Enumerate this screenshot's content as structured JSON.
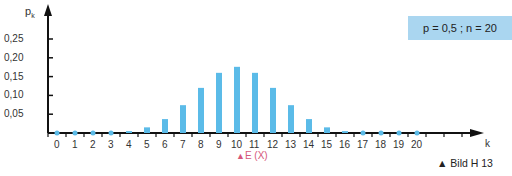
{
  "chart_data": {
    "type": "bar",
    "title": "",
    "xlabel": "k",
    "ylabel": "p_k",
    "categories": [
      "0",
      "1",
      "2",
      "3",
      "4",
      "5",
      "6",
      "7",
      "8",
      "9",
      "10",
      "11",
      "12",
      "13",
      "14",
      "15",
      "16",
      "17",
      "18",
      "19",
      "20"
    ],
    "values": [
      0.0,
      0.0,
      0.0,
      0.001,
      0.005,
      0.015,
      0.037,
      0.074,
      0.12,
      0.16,
      0.176,
      0.16,
      0.12,
      0.074,
      0.037,
      0.015,
      0.005,
      0.001,
      0.0,
      0.0,
      0.0
    ],
    "ylim": [
      0,
      0.27
    ],
    "yticks": [
      "0,05",
      "0,10",
      "0,15",
      "0,20",
      "0,25"
    ],
    "ytick_values": [
      0.05,
      0.1,
      0.15,
      0.2,
      0.25
    ],
    "grid": false,
    "legend": "p = 0,5 ; n = 20",
    "annotations": [
      "E (X)"
    ]
  },
  "labels": {
    "ylabel": "p",
    "ylabel_sub": "k",
    "xlabel": "k",
    "params": "p = 0,5 ; n = 20",
    "expected": "E (X)",
    "caption": "▲ Bild H 13"
  },
  "colors": {
    "bar": "#5bbbe8",
    "axis": "#111111",
    "annotation": "#d6587a",
    "param_box": "#aad6f0"
  }
}
